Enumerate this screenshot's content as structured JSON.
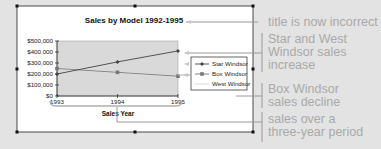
{
  "chart_data": {
    "type": "line",
    "title": "Sales by Model 1992-1995",
    "xlabel": "Sales Year",
    "ylabel": "",
    "categories": [
      "1993",
      "1994",
      "1995"
    ],
    "y_ticks": [
      "$500,000",
      "$400,000",
      "$300,000",
      "$200,000",
      "$100,000",
      "$0"
    ],
    "ylim": [
      0,
      500000
    ],
    "grid": false,
    "legend_position": "right",
    "series": [
      {
        "name": "Star Windsor",
        "values": [
          200000,
          310000,
          410000
        ],
        "color": "#444444",
        "marker": "diamond"
      },
      {
        "name": "Box Windsor",
        "values": [
          250000,
          215000,
          180000
        ],
        "color": "#777777",
        "marker": "square"
      },
      {
        "name": "West Windsor",
        "values": [
          250000,
          215000,
          180000
        ],
        "color": "#e8e8e8",
        "marker": "none"
      }
    ],
    "plot_background": "#d9d9d9"
  },
  "callouts": [
    {
      "id": "title",
      "lines": [
        "title is now incorrect"
      ]
    },
    {
      "id": "increase",
      "lines": [
        "Star and West",
        "Windsor sales",
        "increase"
      ]
    },
    {
      "id": "decline",
      "lines": [
        "Box Windsor",
        "sales decline"
      ]
    },
    {
      "id": "period",
      "lines": [
        "sales over a",
        "three-year period"
      ]
    }
  ],
  "colors": {
    "background": "#e3e3e3",
    "chart_area": "#ffffff",
    "callout_text": "#a9a9a9",
    "leader_lines": "#9a9a9a"
  }
}
